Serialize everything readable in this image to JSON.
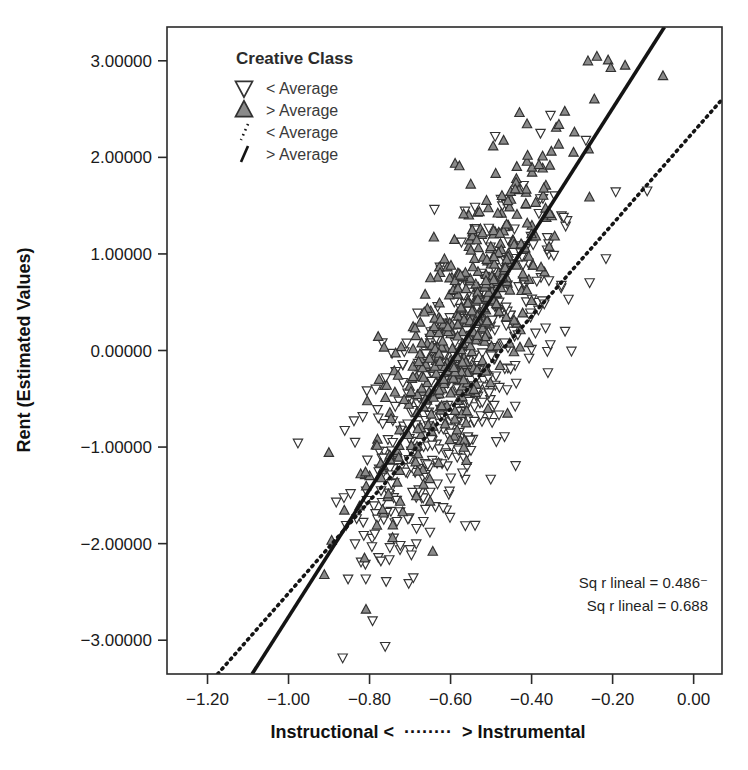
{
  "chart_data": {
    "type": "scatter",
    "title": "",
    "xlabel": "Instructional < ········ > Instrumental",
    "xlabel_left": "Instructional <",
    "xlabel_right": "> Instrumental",
    "ylabel": "Rent (Estimated Values)",
    "xlim": [
      -1.3,
      0.07
    ],
    "ylim": [
      -3.35,
      3.35
    ],
    "xticks": [
      -1.2,
      -1.0,
      -0.8,
      -0.6,
      -0.4,
      -0.2,
      0.0
    ],
    "xtick_labels": [
      "−1.20",
      "−1.00",
      "−0.80",
      "−0.60",
      "−0.40",
      "−0.20",
      "0.00"
    ],
    "yticks": [
      3,
      2,
      1,
      0,
      -1,
      -2,
      -3
    ],
    "ytick_labels": [
      "3.00000",
      "2.00000",
      "1.00000",
      "0.00000",
      "−1.00000",
      "−2.00000",
      "−3.00000"
    ],
    "grid": false,
    "legend_position": "top-left-inside",
    "legend": {
      "title": "Creative Class",
      "entries": [
        {
          "label": "< Average",
          "marker": "triangle-down",
          "fill": "#ffffff",
          "stroke": "#333333"
        },
        {
          "label": "> Average",
          "marker": "triangle-up",
          "fill": "#8a8a8a",
          "stroke": "#303030"
        },
        {
          "label": "< Average",
          "marker": "line-dotted",
          "stroke": "#141414"
        },
        {
          "label": "> Average",
          "marker": "line-solid",
          "stroke": "#141414"
        }
      ]
    },
    "annotations": [
      {
        "text": "Sq r lineal = 0.486⁻",
        "x": 0.0,
        "y": 0.0
      },
      {
        "text": "Sq r lineal = 0.688",
        "x": 0.0,
        "y": 0.0
      }
    ],
    "fit_lines": [
      {
        "name": "< Average (dotted)",
        "style": "dotted",
        "r_squared": 0.486,
        "x0": -1.175,
        "y0": -3.35,
        "x1": 0.07,
        "y1": 2.6
      },
      {
        "name": "> Average (solid)",
        "style": "solid",
        "r_squared": 0.688,
        "x0": -1.09,
        "y0": -3.35,
        "x1": -0.072,
        "y1": 3.35
      }
    ],
    "series": [
      {
        "name": "< Average",
        "marker": "triangle-down",
        "fill": "#ffffff",
        "stroke": "#333333",
        "n_points": 470,
        "x_mean": -0.6,
        "y_mean": -0.45,
        "x_sd": 0.13,
        "slope": 5.4,
        "resid_sd": 0.62,
        "seed": 20147
      },
      {
        "name": "> Average",
        "marker": "triangle-up",
        "fill": "#8a8a8a",
        "stroke": "#303030",
        "n_points": 470,
        "x_mean": -0.555,
        "y_mean": 0.36,
        "x_sd": 0.125,
        "slope": 6.6,
        "resid_sd": 0.55,
        "seed": 90233
      }
    ]
  }
}
